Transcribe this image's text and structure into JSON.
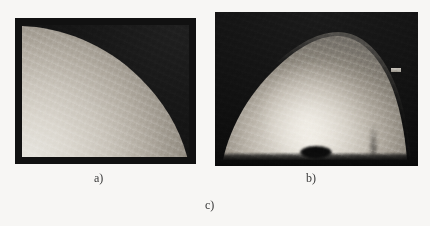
{
  "figure": {
    "background_color": "#f7f6f4",
    "width": 430,
    "height": 226,
    "panels": [
      {
        "id": "a",
        "caption": "a)",
        "kind": "grayscale-medical-image",
        "description": "Dark framed grayscale image with a bright tissue region filling the lower-left, bounded above by a smooth concave-down curve running from the upper-left corner to the lower-right corner.",
        "frame_color": "#111111",
        "background_color": "#0e0e0e",
        "tissue_bright_color": "#e8e6e0",
        "tissue_dark_color": "#474340",
        "bounds": {
          "x": 15,
          "y": 18,
          "width": 181,
          "height": 146
        }
      },
      {
        "id": "b",
        "caption": "b)",
        "kind": "grayscale-medical-image",
        "description": "Dark image containing a bright dome-shaped mound with a brighter core, a dark horizontal band along the bottom, a small dark ellipse at the bottom centre and a small bright rectangular marker near the right edge.",
        "background_color": "#0b0b0b",
        "dome_bright_color": "#efece5",
        "dome_dark_color": "#2c2a28",
        "marker_color": "#d8d4cc",
        "bounds": {
          "x": 215,
          "y": 12,
          "width": 203,
          "height": 154
        }
      }
    ],
    "overall_caption": "c)",
    "caption_color": "#3a3a3a"
  }
}
